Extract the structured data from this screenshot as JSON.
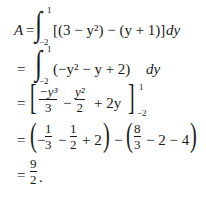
{
  "derivation": {
    "line1": {
      "lhs": "A",
      "eq": "=",
      "integral": "∫",
      "upper": "1",
      "lower": "−2",
      "integrand": "[(3 − y²) − (y + 1)]",
      "d": "dy"
    },
    "line2": {
      "eq": "=",
      "integral": "∫",
      "upper": "1",
      "lower": "−2",
      "integrand": "(−y² − y + 2)",
      "d": "dy"
    },
    "line3": {
      "eq": "=",
      "open_bracket": "[",
      "frac1_num": "−y³",
      "frac1_den": "3",
      "minus": "−",
      "frac2_num": "y²",
      "frac2_den": "2",
      "tail": "+ 2y",
      "close_bracket": "]",
      "upper": "1",
      "lower": "−2"
    },
    "line4": {
      "eq": "=",
      "open1": "(",
      "neg": "−",
      "f1_num": "1",
      "f1_den": "3",
      "minus1": "−",
      "f2_num": "1",
      "f2_den": "2",
      "plus2": "+ 2",
      "close1": ")",
      "minus_mid": "−",
      "open2": "(",
      "f3_num": "8",
      "f3_den": "3",
      "tail2": "− 2 − 4",
      "close2": ")"
    },
    "line5": {
      "eq": "=",
      "num": "9",
      "den": "2",
      "period": "."
    }
  }
}
